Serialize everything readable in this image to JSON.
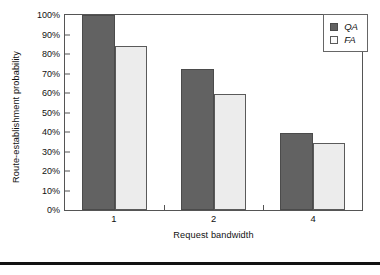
{
  "chart_data": {
    "type": "bar",
    "title": "",
    "xlabel": "Request bandwidth",
    "ylabel": "Route-establishment probability",
    "categories": [
      "1",
      "2",
      "4"
    ],
    "series": [
      {
        "name": "QA",
        "values": [
          100,
          72.5,
          39.5
        ],
        "color": "#626262"
      },
      {
        "name": "FA",
        "values": [
          84,
          59.5,
          34.5
        ],
        "color": "#ececec"
      }
    ],
    "ylim": [
      0,
      100
    ],
    "ytick_labels": [
      "100%",
      "90%",
      "80%",
      "70%",
      "60%",
      "50%",
      "40%",
      "30%",
      "20%",
      "10%",
      "0%"
    ],
    "ytick_values": [
      100,
      90,
      80,
      70,
      60,
      50,
      40,
      30,
      20,
      10,
      0
    ],
    "grid": false,
    "legend_position": "top-right",
    "legend": [
      {
        "label": "QA",
        "swatch": "dark-gray-filled"
      },
      {
        "label": "FA",
        "swatch": "light-gray-outlined"
      }
    ]
  }
}
